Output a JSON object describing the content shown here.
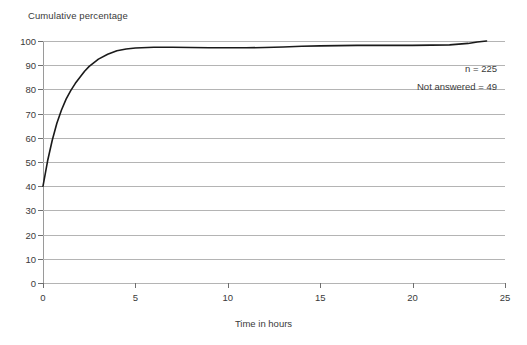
{
  "chart_data": {
    "type": "line",
    "title": "Cumulative percentage",
    "xlabel": "Time in hours",
    "ylabel": "",
    "xlim": [
      0,
      25
    ],
    "ylim": [
      0,
      100
    ],
    "grid": true,
    "legend": false,
    "x_ticks": [
      0,
      5,
      10,
      15,
      20,
      25
    ],
    "x_tick_labels": [
      "0",
      "5",
      "10",
      "15",
      "20",
      "25"
    ],
    "y_ticks": [
      0,
      10,
      20,
      30,
      40,
      50,
      60,
      70,
      80,
      90,
      100
    ],
    "y_tick_labels": [
      "0",
      "10",
      "20",
      "30",
      "40",
      "50",
      "60",
      "70",
      "80",
      "90",
      "100"
    ],
    "series": [
      {
        "name": "Cumulative percentage",
        "color": "#1a1a1a",
        "x": [
          0,
          0.25,
          0.5,
          0.75,
          1,
          1.25,
          1.5,
          1.75,
          2,
          2.25,
          2.5,
          3,
          3.5,
          4,
          4.5,
          5,
          6,
          7,
          8,
          9,
          10,
          11,
          12,
          13,
          14,
          15,
          16,
          17,
          18,
          19,
          20,
          21,
          22,
          23,
          23.5,
          24
        ],
        "y": [
          40,
          50.5,
          59,
          66,
          71.5,
          76,
          79.5,
          82.5,
          85,
          87.5,
          89.5,
          92.5,
          94.5,
          96,
          96.7,
          97.1,
          97.4,
          97.4,
          97.3,
          97.2,
          97.2,
          97.2,
          97.3,
          97.5,
          97.8,
          98,
          98.1,
          98.2,
          98.2,
          98.2,
          98.2,
          98.3,
          98.4,
          99.0,
          99.6,
          100
        ]
      }
    ],
    "annotations": [
      {
        "id": "n",
        "text": "n = 225"
      },
      {
        "id": "not_answered",
        "text": "Not answered = 49"
      }
    ]
  }
}
